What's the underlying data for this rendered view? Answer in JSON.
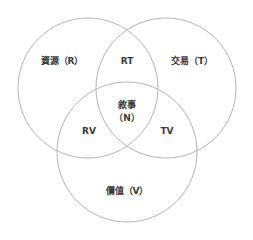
{
  "diagram": {
    "type": "venn-3-set",
    "background_color": "#ffffff",
    "stroke_color": "#b5b5b5",
    "text_color": "#3a3a3a",
    "sets": [
      {
        "key": "resource",
        "label": "資源（R）",
        "symbol": "R",
        "center_x": 88,
        "center_y": 88,
        "radius": 70
      },
      {
        "key": "transaction",
        "label": "交易（T）",
        "symbol": "T",
        "center_x": 166,
        "center_y": 88,
        "radius": 70
      },
      {
        "key": "value",
        "label": "價值（V）",
        "symbol": "V",
        "center_x": 127,
        "center_y": 152,
        "radius": 70
      }
    ],
    "intersections": [
      {
        "key": "rt",
        "label": "RT",
        "center_x": 127,
        "center_y": 61
      },
      {
        "key": "rv",
        "label": "RV",
        "center_x": 89,
        "center_y": 131
      },
      {
        "key": "tv",
        "label": "TV",
        "center_x": 167,
        "center_y": 131
      },
      {
        "key": "center",
        "label_line1": "敘事",
        "label_line2": "（N）",
        "symbol": "N",
        "center_x": 127,
        "center_y": 112
      }
    ]
  }
}
